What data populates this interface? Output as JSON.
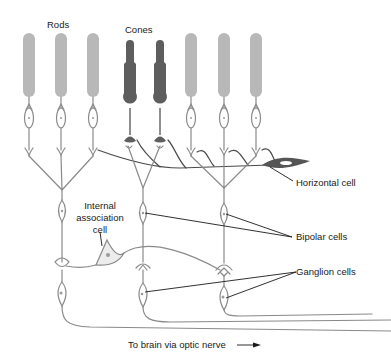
{
  "diagram": {
    "type": "retina-cell-layers",
    "labels": {
      "rods": "Rods",
      "cones": "Cones",
      "horizontal_cell": "Horizontal cell",
      "internal_association_line1": "Internal",
      "internal_association_line2": "association",
      "internal_association_line3": "cell",
      "bipolar_cells": "Bipolar cells",
      "ganglion_cells": "Ganglion cells",
      "optic_nerve": "To brain via optic nerve"
    },
    "colors": {
      "rod": "#b8b8b8",
      "cone": "#5e5e5e",
      "neuron_outline": "#8a8a8a",
      "horizontal_cell": "#555555",
      "label_text": "#1a1a1a",
      "background": "#ffffff"
    },
    "counts": {
      "rods": 6,
      "cones": 2,
      "bipolar_cells": 3,
      "ganglion_cells": 3,
      "horizontal_cells": 1,
      "internal_association_cells": 1
    }
  }
}
